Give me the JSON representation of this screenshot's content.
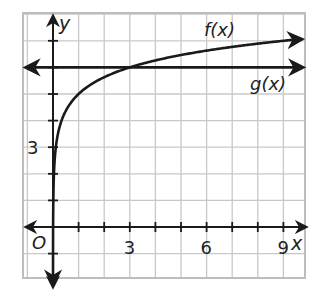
{
  "chart_data": {
    "type": "line",
    "title": "",
    "xlabel": "x",
    "ylabel": "y",
    "origin_label": "O",
    "xlim": [
      -1.15,
      9.85
    ],
    "ylim": [
      -1.9,
      8.1
    ],
    "grid": true,
    "grid_step": 1,
    "x_tick_labels": [
      {
        "value": 3,
        "label": "3"
      },
      {
        "value": 6,
        "label": "6"
      },
      {
        "value": 9,
        "label": "9"
      }
    ],
    "y_tick_labels": [
      {
        "value": 3,
        "label": "3"
      }
    ],
    "series": [
      {
        "name": "f(x)",
        "label": "f(x)",
        "formula": "log_3(x) + 5",
        "x": [
          0.3,
          0.333,
          0.5,
          1,
          2,
          3,
          4,
          5,
          6,
          7,
          8,
          9,
          9.7
        ],
        "y": [
          3.9,
          4.0,
          4.37,
          5.0,
          5.63,
          6.0,
          6.26,
          6.46,
          6.63,
          6.77,
          6.89,
          7.0,
          7.07
        ]
      },
      {
        "name": "g(x)",
        "label": "g(x)",
        "formula": "6",
        "x": [
          -1,
          9.7
        ],
        "y": [
          6,
          6
        ]
      }
    ],
    "annotations": [
      {
        "text": "f(x)",
        "near": [
          7.0,
          7.6
        ]
      },
      {
        "text": "g(x)",
        "near": [
          8.6,
          5.4
        ]
      }
    ]
  },
  "colors": {
    "curve": "#1a1a1a",
    "grid": "#c8c8c8",
    "axis": "#1a1a1a",
    "background": "#ffffff"
  }
}
